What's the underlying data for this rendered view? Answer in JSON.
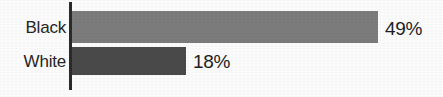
{
  "chart_data": {
    "type": "bar",
    "orientation": "horizontal",
    "title": "",
    "subtitle": "",
    "xlabel": "",
    "ylabel": "",
    "categories": [
      "Black",
      "White"
    ],
    "values": [
      49,
      18
    ],
    "value_labels": [
      "49%",
      "18%"
    ],
    "unit": "%",
    "xlim": [
      0,
      100
    ],
    "grid": false,
    "legend": false,
    "legend_position": "none",
    "series": [
      {
        "name": "",
        "values": [
          49,
          18
        ],
        "labels": [
          "49%",
          "18%"
        ]
      }
    ],
    "bars": [
      {
        "category": "Black",
        "value": 49,
        "label": "49%",
        "color": "#7d7d7d"
      },
      {
        "category": "White",
        "value": 18,
        "label": "18%",
        "color": "#4a4a4a"
      }
    ],
    "colors": {
      "background": "#fdfdfd",
      "axis_line": "#2b2b2b",
      "bar_black": "#7d7d7d",
      "bar_white": "#4a4a4a",
      "category_text": "#262626",
      "value_text": "#1f1f1f"
    }
  }
}
